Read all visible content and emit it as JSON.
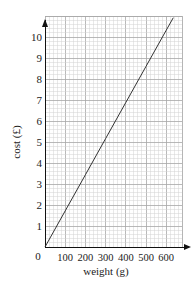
{
  "chart_data": {
    "type": "line",
    "title": "",
    "xlabel": "weight (g)",
    "ylabel": "cost (£)",
    "x_ticks": [
      "0",
      "100",
      "200",
      "300",
      "400",
      "500",
      "600"
    ],
    "y_ticks": [
      "1",
      "2",
      "3",
      "4",
      "5",
      "6",
      "7",
      "8",
      "9",
      "10"
    ],
    "origin_label": "0",
    "xlim": [
      0,
      680
    ],
    "ylim": [
      0,
      11
    ],
    "grid": true,
    "legend": null,
    "series": [
      {
        "name": "cost",
        "x": [
          0,
          100,
          200,
          300,
          400,
          500,
          600,
          635
        ],
        "y": [
          0,
          1.72,
          3.44,
          5.16,
          6.88,
          8.6,
          10.32,
          10.92
        ]
      }
    ],
    "colors": {
      "line": "#333333",
      "minor_grid": "#d4d4d4",
      "major_grid": "#a8a8a8",
      "axis": "#111111"
    }
  }
}
